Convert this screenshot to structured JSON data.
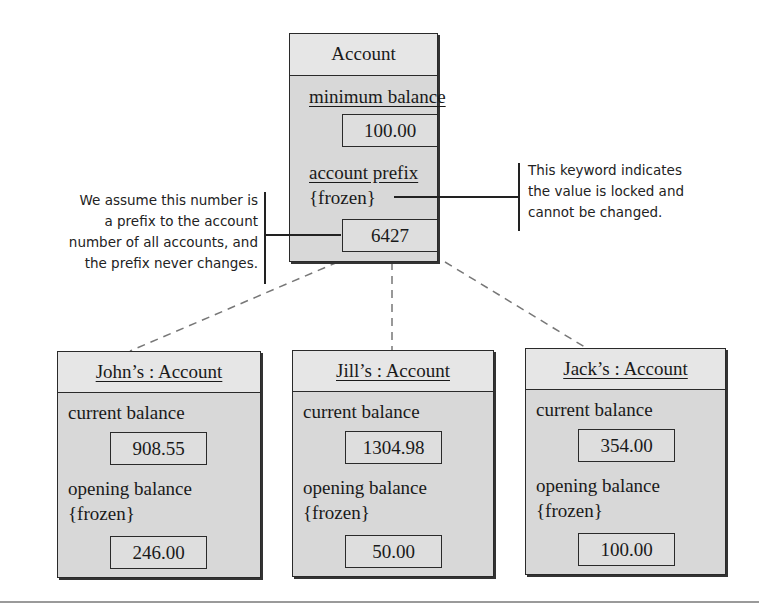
{
  "class_box": {
    "title": "Account",
    "attributes": [
      {
        "name": "minimum balance",
        "constraint": "",
        "value": "100.00"
      },
      {
        "name": "account prefix",
        "constraint": "{frozen}",
        "value": "6427"
      }
    ]
  },
  "annotations": {
    "left": [
      "We assume this number is",
      "a prefix to the account",
      "number of all accounts, and",
      "the prefix never changes."
    ],
    "right": [
      "This keyword indicates",
      "the value is locked and",
      "cannot be changed."
    ]
  },
  "instances": [
    {
      "title": "John’s : Account",
      "current_label": "current balance",
      "current_value": "908.55",
      "opening_label": "opening balance",
      "opening_constraint": "{frozen}",
      "opening_value": "246.00"
    },
    {
      "title": "Jill’s : Account",
      "current_label": "current balance",
      "current_value": "1304.98",
      "opening_label": "opening balance",
      "opening_constraint": "{frozen}",
      "opening_value": "50.00"
    },
    {
      "title": "Jack’s : Account",
      "current_label": "current balance",
      "current_value": "354.00",
      "opening_label": "opening balance",
      "opening_constraint": "{frozen}",
      "opening_value": "100.00"
    }
  ],
  "colors": {
    "box_fill": "#d8d8d8",
    "header_fill": "#e6e6e6",
    "border": "#2a2a2a",
    "connector": "#777777"
  }
}
